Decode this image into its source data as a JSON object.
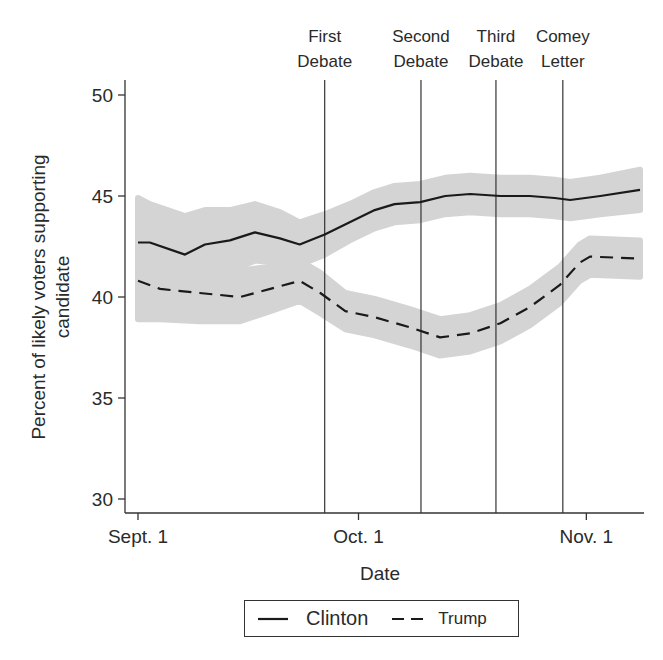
{
  "chart_data": {
    "type": "line",
    "title": "",
    "xlabel": "Date",
    "ylabel": "Percent of likely voters supporting candidate",
    "ylabel_lines": [
      "Percent of likely voters supporting",
      "candidate"
    ],
    "ylim": [
      30,
      50
    ],
    "yticks": [
      30,
      35,
      40,
      45,
      50
    ],
    "xticks": [
      {
        "label": "Sept. 1",
        "day": 0
      },
      {
        "label": "Oct. 1",
        "day": 30
      },
      {
        "label": "Nov. 1",
        "day": 61
      }
    ],
    "x_units": "days since Sept. 1",
    "xlim_days": [
      0,
      68.3
    ],
    "grid": false,
    "legend_position": "bottom-center",
    "events": [
      {
        "label_line1": "First",
        "label_line2": "Debate",
        "day": 25.4
      },
      {
        "label_line1": "Second",
        "label_line2": "Debate",
        "day": 38.5
      },
      {
        "label_line1": "Third",
        "label_line2": "Debate",
        "day": 48.7
      },
      {
        "label_line1": "Comey",
        "label_line2": "Letter",
        "day": 57.8
      }
    ],
    "series": [
      {
        "name": "Clinton",
        "style": "solid",
        "day": [
          0,
          1.6,
          6.4,
          9.1,
          12.5,
          15.9,
          19.3,
          22.0,
          25.4,
          28.8,
          32.2,
          34.9,
          38.4,
          41.8,
          45.2,
          49.3,
          53.3,
          56.7,
          58.8,
          62.9,
          68.3
        ],
        "values": [
          42.7,
          42.7,
          42.1,
          42.6,
          42.8,
          43.2,
          42.9,
          42.6,
          43.1,
          43.7,
          44.3,
          44.6,
          44.7,
          45.0,
          45.1,
          45.0,
          45.0,
          44.9,
          44.8,
          45.0,
          45.3
        ],
        "ci_lower": [
          40.5,
          40.6,
          40.2,
          40.9,
          41.3,
          41.8,
          41.7,
          41.6,
          42.1,
          42.8,
          43.4,
          43.7,
          43.8,
          44.1,
          44.2,
          44.1,
          44.1,
          44.0,
          43.9,
          44.1,
          44.3
        ],
        "ci_upper": [
          44.9,
          44.6,
          44.0,
          44.3,
          44.3,
          44.6,
          44.2,
          43.7,
          44.1,
          44.6,
          45.2,
          45.5,
          45.6,
          45.9,
          46.0,
          45.9,
          45.9,
          45.8,
          45.7,
          45.9,
          46.3
        ]
      },
      {
        "name": "Trump",
        "style": "dashed",
        "day": [
          0,
          3.0,
          8.4,
          13.9,
          18.0,
          22.0,
          24.8,
          28.2,
          32.2,
          37.0,
          41.1,
          45.2,
          49.3,
          53.3,
          57.4,
          60.1,
          61.5,
          68.3
        ],
        "values": [
          40.8,
          40.4,
          40.2,
          40.0,
          40.4,
          40.8,
          40.2,
          39.3,
          39.0,
          38.5,
          38.0,
          38.2,
          38.7,
          39.5,
          40.6,
          41.7,
          42.0,
          41.9
        ],
        "ci_lower": [
          38.9,
          38.9,
          38.8,
          38.8,
          39.3,
          39.8,
          39.2,
          38.4,
          38.1,
          37.6,
          37.1,
          37.3,
          37.8,
          38.6,
          39.7,
          40.8,
          41.1,
          41.0
        ],
        "ci_upper": [
          42.7,
          41.9,
          41.6,
          41.3,
          41.5,
          41.8,
          41.2,
          40.2,
          39.9,
          39.4,
          38.9,
          39.1,
          39.6,
          40.4,
          41.5,
          42.6,
          42.9,
          42.8
        ]
      }
    ]
  },
  "legend": {
    "items": [
      {
        "label": "Clinton",
        "style": "solid"
      },
      {
        "label": "Trump",
        "style": "dashed"
      }
    ]
  },
  "colors": {
    "line": "#1a1a1a",
    "band": "#d4d4d4",
    "axis": "#333333"
  }
}
